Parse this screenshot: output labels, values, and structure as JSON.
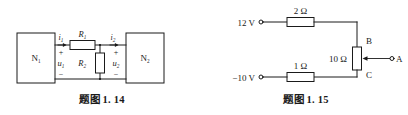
{
  "page": {
    "background": "#ffffff",
    "ink": "#1a1a1a",
    "width": 408,
    "height": 115
  },
  "figures": [
    {
      "id": "fig-1-14",
      "caption": "题图 1. 14",
      "type": "two-port-network-schematic",
      "blocks": [
        {
          "name": "network-1",
          "label": "N",
          "subscript": "1"
        },
        {
          "name": "network-2",
          "label": "N",
          "subscript": "2"
        }
      ],
      "currents": [
        {
          "name": "current-i1",
          "label": "i",
          "subscript": "1",
          "direction": "right"
        },
        {
          "name": "current-i2",
          "label": "i",
          "subscript": "2",
          "direction": "right"
        }
      ],
      "voltages": [
        {
          "name": "voltage-u1",
          "label": "u",
          "subscript": "1",
          "plus": "+",
          "minus": "−"
        },
        {
          "name": "voltage-u2",
          "label": "u",
          "subscript": "2",
          "plus": "+",
          "minus": "−"
        }
      ],
      "resistors": [
        {
          "name": "resistor-r1",
          "label": "R",
          "subscript": "1",
          "orientation": "horizontal"
        },
        {
          "name": "resistor-r2",
          "label": "R",
          "subscript": "2",
          "orientation": "vertical"
        }
      ]
    },
    {
      "id": "fig-1-15",
      "caption": "题图 1. 15",
      "type": "potentiometer-divider-schematic",
      "sources": [
        {
          "name": "source-12v",
          "label": "12 V",
          "terminal": "open-circle"
        },
        {
          "name": "source-neg10v",
          "label": "−10 V",
          "terminal": "open-circle"
        }
      ],
      "resistors": [
        {
          "name": "resistor-2ohm",
          "label": "2 Ω",
          "orientation": "horizontal"
        },
        {
          "name": "resistor-1ohm",
          "label": "1 Ω",
          "orientation": "horizontal"
        },
        {
          "name": "resistor-10ohm",
          "label": "10 Ω",
          "orientation": "vertical",
          "kind": "potentiometer"
        }
      ],
      "nodes": [
        {
          "name": "node-b",
          "label": "B"
        },
        {
          "name": "node-c",
          "label": "C"
        },
        {
          "name": "terminal-a",
          "label": "A",
          "terminal": "open-circle"
        }
      ],
      "wiper": {
        "name": "wiper-arrow",
        "direction": "left",
        "from": "terminal-a",
        "to": "resistor-10ohm"
      }
    }
  ]
}
